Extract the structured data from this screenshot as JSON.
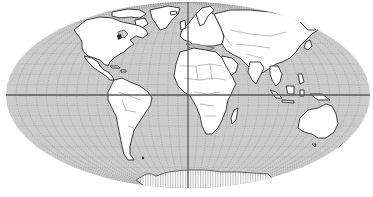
{
  "map": {
    "projection": "Mollweide",
    "center": {
      "x": 188,
      "y": 95
    },
    "radius_x": 182,
    "radius_y": 93,
    "colors": {
      "ocean": "#cbcbcb",
      "land": "#ffffff",
      "coastline": "#2a2a2a",
      "graticule": "#9a9a9a",
      "axis": "#5a5a5a"
    },
    "axes": {
      "equator": {
        "y": 95,
        "x1": 6,
        "x2": 370
      },
      "central_meridian": {
        "x": 188,
        "y1": 2,
        "y2": 188
      }
    },
    "graticule": {
      "meridian_count": 36,
      "parallel_count": 18,
      "style": "dotted"
    },
    "regions": [
      "north-america",
      "greenland",
      "central-america",
      "south-america",
      "europe",
      "africa",
      "madagascar",
      "asia",
      "arabian-peninsula",
      "india",
      "japan",
      "southeast-asia",
      "indonesia",
      "australia",
      "new-zealand",
      "antarctica"
    ]
  }
}
